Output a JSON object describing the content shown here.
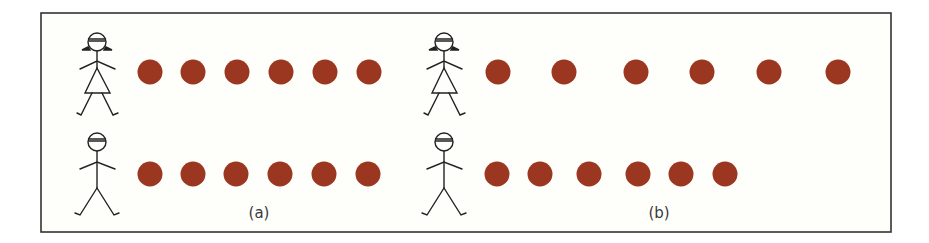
{
  "figure": {
    "frame": {
      "x": 41,
      "y": 13,
      "width": 850,
      "height": 219,
      "stroke": "#333333",
      "fill": "#fefefb"
    },
    "dot_color": "#9b3620",
    "dot_radius": 12.5,
    "figure_stroke": "#222222",
    "panels": [
      {
        "id": "a",
        "label": "(a)",
        "label_x": 259,
        "label_y": 218,
        "rows": [
          {
            "person": "girl-icon",
            "person_x": 97,
            "person_y": 30,
            "dot_y": 72,
            "dot_count": 6,
            "dot_x": [
              150,
              193,
              237,
              281,
              325,
              369
            ]
          },
          {
            "person": "boy-icon",
            "person_x": 97,
            "person_y": 132,
            "dot_y": 174,
            "dot_count": 6,
            "dot_x": [
              150,
              193,
              236,
              280,
              324,
              368
            ]
          }
        ]
      },
      {
        "id": "b",
        "label": "(b)",
        "label_x": 659,
        "label_y": 218,
        "rows": [
          {
            "person": "girl-icon",
            "person_x": 444,
            "person_y": 30,
            "dot_y": 72,
            "dot_count": 6,
            "dot_x": [
              498,
              564,
              636,
              702,
              769,
              838
            ]
          },
          {
            "person": "boy-icon",
            "person_x": 444,
            "person_y": 132,
            "dot_y": 174,
            "dot_count": 6,
            "dot_x": [
              497,
              540,
              589,
              638,
              681,
              725
            ]
          }
        ]
      }
    ]
  }
}
